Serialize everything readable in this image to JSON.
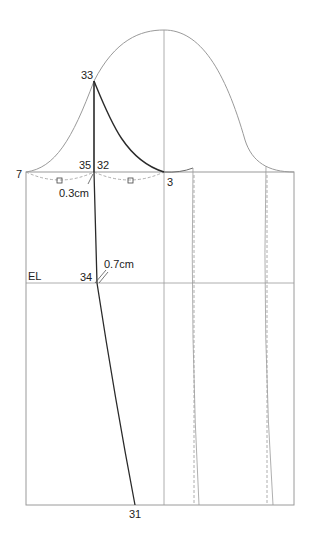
{
  "diagram": {
    "type": "sleeve pattern draft",
    "colors": {
      "line": "#9a9a9a",
      "bold": "#2a2a2a",
      "text": "#222222"
    },
    "labels": {
      "p7": "7",
      "p35": "35",
      "p32": "32",
      "p33": "33",
      "p3": "3",
      "p34": "34",
      "p31": "31",
      "el": "EL",
      "m03": "0.3cm",
      "m07": "0.7cm"
    },
    "markers": [
      "square",
      "square"
    ]
  }
}
